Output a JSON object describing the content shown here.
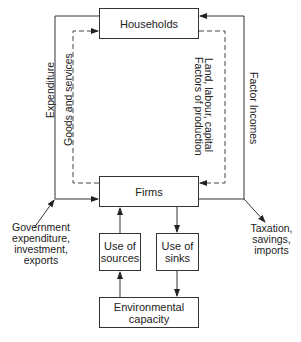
{
  "diagram": {
    "nodes": {
      "households": "Households",
      "firms": "Firms",
      "use_of_sources": [
        "Use of",
        "sources"
      ],
      "use_of_sinks": [
        "Use of",
        "sinks"
      ],
      "environmental_capacity": [
        "Environmental",
        "capacity"
      ]
    },
    "flows": {
      "expenditure": "Expenditure",
      "goods_and_services": "Goods and services",
      "land_labour_capital": "Land, labour, capital",
      "factors_of_production": "Factors of production",
      "factor_incomes": "Factor Incomes"
    },
    "injections": [
      "Government",
      "expenditure,",
      "investment,",
      "exports"
    ],
    "leakages": [
      "Taxation,",
      "savings,",
      "imports"
    ]
  }
}
